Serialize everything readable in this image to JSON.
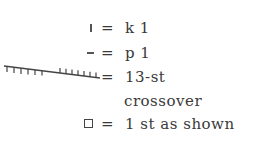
{
  "legend": {
    "items": [
      {
        "symbol": "knit-stitch-symbol",
        "equals": "=",
        "label": "k 1"
      },
      {
        "symbol": "purl-stitch-symbol",
        "equals": "=",
        "label": "p 1"
      },
      {
        "symbol": "crossover-symbol",
        "equals": "=",
        "label": "13-st",
        "label_cont": "crossover"
      },
      {
        "symbol": "square-symbol",
        "equals": "=",
        "label": "1 st as shown"
      }
    ]
  }
}
